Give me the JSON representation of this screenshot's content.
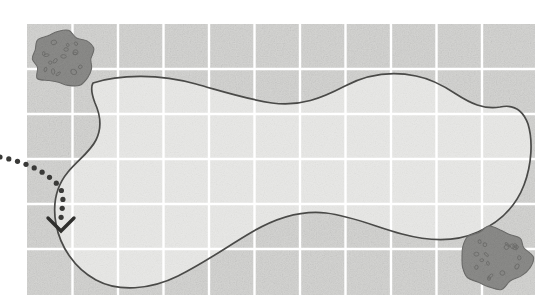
{
  "canvas": {
    "width": 549,
    "height": 304,
    "background": "#ffffff"
  },
  "map": {
    "title": "aerial-field-map",
    "area": {
      "x": 27,
      "y": 24,
      "width": 508,
      "height": 271
    },
    "terrain_color": "#d5d5d3",
    "interior_color": "#e9e9e7",
    "grid": {
      "visible": true,
      "line_color": "#ffffff",
      "line_width": 2.4,
      "cell_width": 45.5,
      "cell_height": 45.2,
      "columns": 11,
      "rows": 6,
      "vertical_lines": [
        72.5,
        118,
        163.5,
        209,
        254.5,
        300,
        345.5,
        391,
        436.5,
        482
      ],
      "horizontal_lines": [
        69,
        114,
        159,
        204,
        249
      ]
    },
    "boundary": {
      "label": "field-boundary-outline",
      "stroke": "#4a4a48",
      "stroke_width": 1.7,
      "fill": "#e9e9e7",
      "closed": true,
      "path": "M 93 83 C 120 74, 160 74, 196 84 C 228 93, 246 99, 272 103 C 300 107, 322 98, 345 86 C 368 74, 392 71, 416 76 C 432 79, 444 86, 456 94 C 470 103, 484 110, 500 107 C 514 104, 523 110, 528 124 C 533 140, 532 164, 524 185 C 516 206, 500 222, 478 232 C 456 242, 428 241, 402 234 C 376 227, 352 216, 326 213 C 300 210, 276 218, 252 232 C 228 246, 206 262, 178 276 C 150 290, 118 292, 96 280 C 74 268, 60 246, 56 224 C 52 202, 58 184, 68 172 C 78 160, 90 152, 96 140 C 102 128, 100 114, 95 103 C 92 95, 90 88, 93 83 Z"
    },
    "blobs": [
      {
        "name": "vegetation-patch-upper-left",
        "cx": 63,
        "cy": 59,
        "rx": 30,
        "ry": 27,
        "fill": "#8d8d8b",
        "stroke": "#6f6f6d",
        "speckle_color": "#6c6c6a",
        "speckle_count": 16
      },
      {
        "name": "vegetation-patch-lower-right",
        "cx": 495,
        "cy": 257,
        "rx": 34,
        "ry": 30,
        "fill": "#8d8d8b",
        "stroke": "#6f6f6d",
        "speckle_color": "#6c6c6a",
        "speckle_count": 18
      }
    ],
    "route": {
      "name": "dotted-entry-path",
      "dot_color": "#3a3a38",
      "dot_radius": 2.6,
      "dot_spacing": 9,
      "path": "M 0 157 C 22 161, 44 170, 58 185 C 66 194, 62 206, 61 218",
      "arrow": {
        "name": "chevron-down-marker",
        "shape": "chevron",
        "direction": "down",
        "tip_x": 61,
        "tip_y": 231,
        "half_width": 13,
        "height": 13,
        "stroke": "#2f2f2d",
        "stroke_width": 3.4
      }
    }
  },
  "legend": {
    "terrain_label": "field",
    "boundary_label": "plot boundary",
    "blob_label": "tree cluster",
    "route_label": "approach path"
  }
}
